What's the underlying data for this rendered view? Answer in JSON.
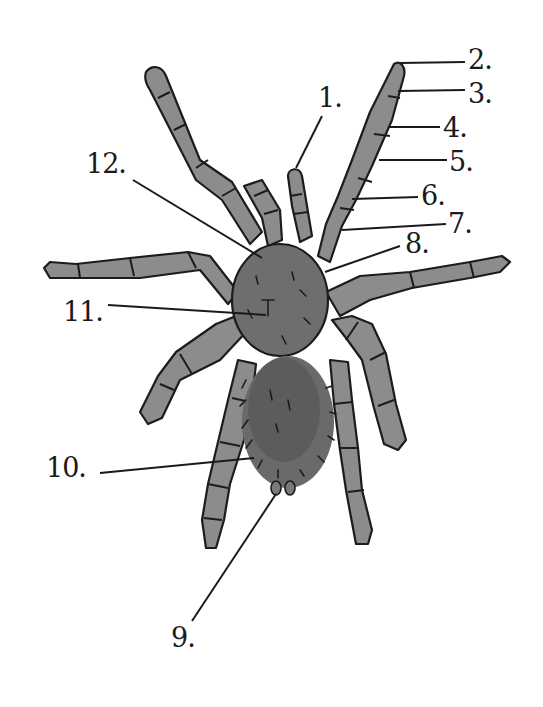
{
  "diagram": {
    "colors": {
      "background": "#ffffff",
      "leg_fill": "#8c8c8c",
      "body_fill": "#6e6e6e",
      "abdomen_fill": "#5c5c5c",
      "ink": "#1c1c1c"
    },
    "labels": [
      {
        "id": "1",
        "text": "1."
      },
      {
        "id": "2",
        "text": "2."
      },
      {
        "id": "3",
        "text": "3."
      },
      {
        "id": "4",
        "text": "4."
      },
      {
        "id": "5",
        "text": "5."
      },
      {
        "id": "6",
        "text": "6."
      },
      {
        "id": "7",
        "text": "7."
      },
      {
        "id": "8",
        "text": "8."
      },
      {
        "id": "9",
        "text": "9."
      },
      {
        "id": "10",
        "text": "10."
      },
      {
        "id": "11",
        "text": "11."
      },
      {
        "id": "12",
        "text": "12."
      }
    ]
  }
}
